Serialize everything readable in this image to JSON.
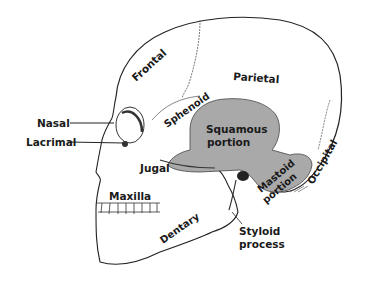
{
  "diagram": {
    "colors": {
      "background": "#ffffff",
      "outline": "#222222",
      "temporal_fill": "#a9a9a9",
      "label": "#1a1a1a"
    },
    "labels": {
      "frontal": "Frontal",
      "parietal": "Parietal",
      "sphenoid": "Sphenoid",
      "squamous_1": "Squamous",
      "squamous_2": "portion",
      "nasal": "Nasal",
      "lacrimal": "Lacrimal",
      "jugal": "Jugal",
      "maxilla": "Maxilla",
      "mastoid_1": "Mastoid",
      "mastoid_2": "portion",
      "occipital": "Occipital",
      "dentary": "Dentary",
      "styloid_1": "Styloid",
      "styloid_2": "process"
    }
  }
}
